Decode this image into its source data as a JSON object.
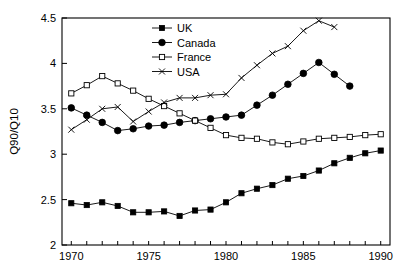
{
  "chart_data": {
    "type": "line",
    "title": "",
    "xlabel": "",
    "ylabel": "Q90/Q10",
    "xlim": [
      1969.4,
      1990.6
    ],
    "ylim": [
      2,
      4.5
    ],
    "xticks": [
      1970,
      1971,
      1972,
      1973,
      1974,
      1975,
      1976,
      1977,
      1978,
      1979,
      1980,
      1981,
      1982,
      1983,
      1984,
      1985,
      1986,
      1987,
      1988,
      1989,
      1990
    ],
    "xtick_labels": [
      "1970",
      "",
      "",
      "",
      "",
      "1975",
      "",
      "",
      "",
      "",
      "1980",
      "",
      "",
      "",
      "",
      "1985",
      "",
      "",
      "",
      "",
      "1990"
    ],
    "yticks": [
      2,
      2.5,
      3,
      3.5,
      4,
      4.5
    ],
    "ytick_labels": [
      "2",
      "2.5",
      "3",
      "3.5",
      "4",
      "4.5"
    ],
    "grid": false,
    "legend_position": "top-center",
    "series": [
      {
        "name": "UK",
        "marker": "filled-square",
        "x": [
          1970,
          1971,
          1972,
          1973,
          1974,
          1975,
          1976,
          1977,
          1978,
          1979,
          1980,
          1981,
          1982,
          1983,
          1984,
          1985,
          1986,
          1987,
          1988,
          1989,
          1990
        ],
        "values": [
          2.46,
          2.44,
          2.47,
          2.43,
          2.36,
          2.36,
          2.37,
          2.32,
          2.38,
          2.39,
          2.47,
          2.57,
          2.62,
          2.66,
          2.73,
          2.76,
          2.82,
          2.9,
          2.96,
          3.01,
          3.04
        ]
      },
      {
        "name": "Canada",
        "marker": "filled-circle",
        "x": [
          1970,
          1971,
          1972,
          1973,
          1974,
          1975,
          1976,
          1977,
          1978,
          1979,
          1980,
          1981,
          1982,
          1983,
          1984,
          1985,
          1986,
          1987,
          1988
        ],
        "values": [
          3.51,
          3.43,
          3.35,
          3.26,
          3.28,
          3.31,
          3.32,
          3.35,
          3.37,
          3.39,
          3.41,
          3.43,
          3.54,
          3.65,
          3.77,
          3.89,
          4.01,
          3.88,
          3.75
        ]
      },
      {
        "name": "France",
        "marker": "open-square",
        "x": [
          1970,
          1971,
          1972,
          1973,
          1974,
          1975,
          1976,
          1977,
          1978,
          1979,
          1980,
          1981,
          1982,
          1983,
          1984,
          1985,
          1986,
          1987,
          1988,
          1989,
          1990
        ],
        "values": [
          3.67,
          3.76,
          3.86,
          3.78,
          3.7,
          3.61,
          3.53,
          3.45,
          3.37,
          3.29,
          3.21,
          3.18,
          3.17,
          3.13,
          3.11,
          3.14,
          3.17,
          3.18,
          3.19,
          3.21,
          3.22
        ]
      },
      {
        "name": "USA",
        "marker": "cross",
        "x": [
          1970,
          1971,
          1972,
          1973,
          1974,
          1975,
          1976,
          1977,
          1978,
          1979,
          1980,
          1981,
          1982,
          1983,
          1984,
          1985,
          1986,
          1987
        ],
        "values": [
          3.27,
          3.38,
          3.5,
          3.52,
          3.36,
          3.47,
          3.57,
          3.62,
          3.62,
          3.65,
          3.66,
          3.84,
          3.98,
          4.11,
          4.19,
          4.36,
          4.47,
          4.4
        ]
      }
    ]
  },
  "legend": {
    "entries": [
      {
        "label": "UK"
      },
      {
        "label": "Canada"
      },
      {
        "label": "France"
      },
      {
        "label": "USA"
      }
    ]
  }
}
